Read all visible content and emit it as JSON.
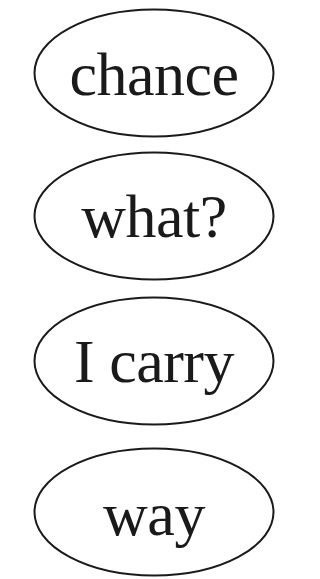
{
  "items": [
    {
      "label": "chance"
    },
    {
      "label": "what?"
    },
    {
      "label": "I carry"
    },
    {
      "label": "way"
    }
  ],
  "style": {
    "stroke_color": "#1a1a1a",
    "text_color": "#1a1a1a",
    "background": "#ffffff"
  }
}
